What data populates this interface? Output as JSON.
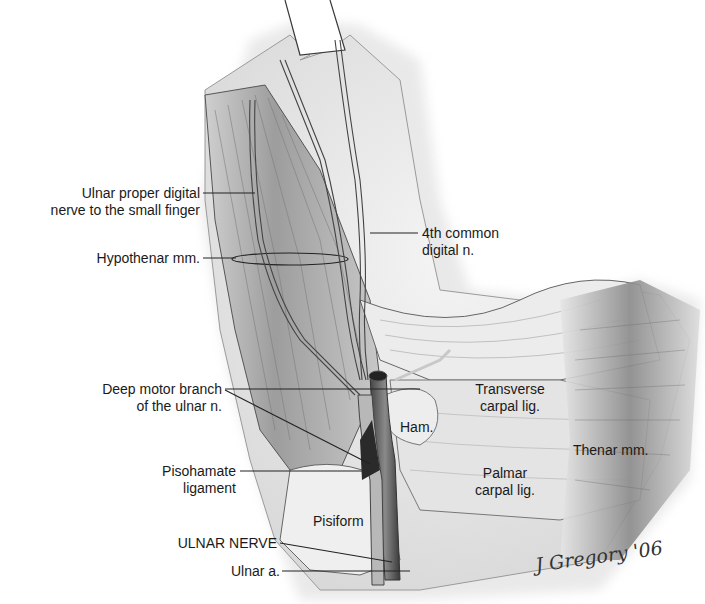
{
  "figure": {
    "labels": {
      "ulnar_proper_digital_1": "Ulnar proper digital",
      "ulnar_proper_digital_2": "nerve to the small finger",
      "hypothenar": "Hypothenar mm.",
      "fourth_common_1": "4th common",
      "fourth_common_2": "digital n.",
      "deep_motor_1": "Deep motor branch",
      "deep_motor_2": "of the ulnar n.",
      "pisohamate_1": "Pisohamate",
      "pisohamate_2": "ligament",
      "ulnar_nerve": "ULNAR NERVE",
      "ulnar_artery": "Ulnar a.",
      "transverse_1": "Transverse",
      "transverse_2": "carpal lig.",
      "hamate": "Ham.",
      "thenar": "Thenar mm.",
      "palmar_1": "Palmar",
      "palmar_2": "carpal lig.",
      "pisiform": "Pisiform"
    },
    "signature": "J Gregory '06"
  },
  "colors": {
    "background": "#ffffff",
    "line": "#2a2a2a",
    "tissue_light": "#e8e8e8",
    "tissue_mid": "#bdbdbd",
    "tissue_dark": "#6e6e6e",
    "vessel": "#555555"
  }
}
